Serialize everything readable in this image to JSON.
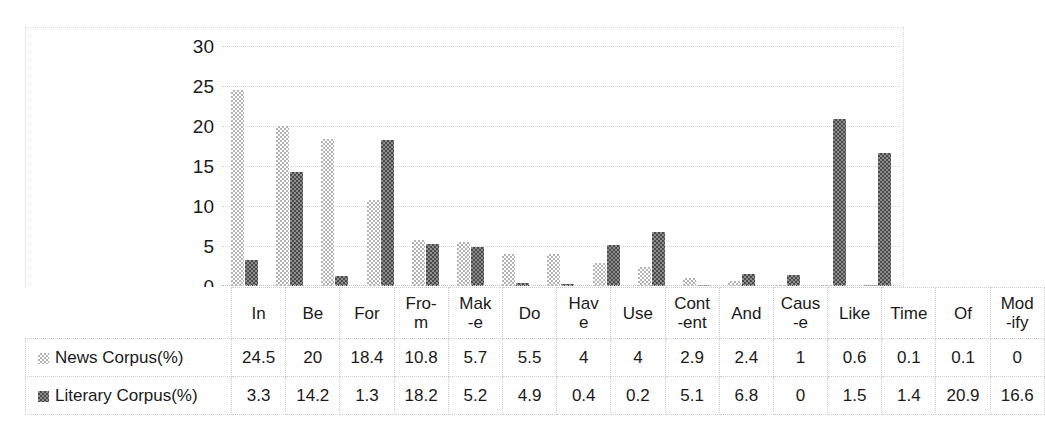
{
  "chart_data": {
    "type": "bar",
    "title": "",
    "xlabel": "",
    "ylabel": "",
    "ylim": [
      0,
      30
    ],
    "yticks": [
      0,
      5,
      10,
      15,
      20,
      25,
      30
    ],
    "grid": true,
    "legend_position": "table-left",
    "categories": [
      "In",
      "Be",
      "For",
      "Fro-m",
      "Mak-e",
      "Do",
      "Hav-e",
      "Use",
      "Cont-ent",
      "And",
      "Caus-e",
      "Like",
      "Time",
      "Of",
      "Mod-ify"
    ],
    "category_lines": [
      [
        "In",
        ""
      ],
      [
        "Be",
        ""
      ],
      [
        "For",
        ""
      ],
      [
        "Fro-",
        "m"
      ],
      [
        "Mak",
        "-e"
      ],
      [
        "Do",
        ""
      ],
      [
        "Hav",
        "e"
      ],
      [
        "Use",
        ""
      ],
      [
        "Cont",
        "-ent"
      ],
      [
        "And",
        ""
      ],
      [
        "Caus",
        "-e"
      ],
      [
        "Like",
        ""
      ],
      [
        "Time",
        ""
      ],
      [
        "Of",
        ""
      ],
      [
        "Mod",
        "-ify"
      ]
    ],
    "series": [
      {
        "name": "News Corpus(%)",
        "color": "#b4b4b4",
        "values": [
          24.5,
          20,
          18.4,
          10.8,
          5.7,
          5.5,
          4,
          4,
          2.9,
          2.4,
          1,
          0.6,
          0.1,
          0.1,
          0
        ],
        "labels": [
          "24.5",
          "20",
          "18.4",
          "10.8",
          "5.7",
          "5.5",
          "4",
          "4",
          "2.9",
          "2.4",
          "1",
          "0.6",
          "0.1",
          "0.1",
          "0"
        ]
      },
      {
        "name": "Literary Corpus(%)",
        "color": "#4a4a4a",
        "values": [
          3.3,
          14.2,
          1.3,
          18.2,
          5.2,
          4.9,
          0.4,
          0.2,
          5.1,
          6.8,
          0,
          1.5,
          1.4,
          20.9,
          16.6
        ],
        "labels": [
          "3.3",
          "14.2",
          "1.3",
          "18.2",
          "5.2",
          "4.9",
          "0.4",
          "0.2",
          "5.1",
          "6.8",
          "0",
          "1.5",
          "1.4",
          "20.9",
          "16.6"
        ]
      }
    ]
  }
}
